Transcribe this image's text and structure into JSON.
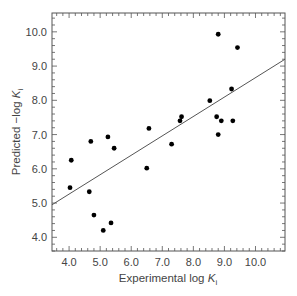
{
  "chart_data": {
    "type": "scatter",
    "title": "",
    "xlabel": "Experimental log K_i",
    "xlabel_main": "Experimental log ",
    "xlabel_var": "K",
    "xlabel_sub": "i",
    "ylabel": "Predicted −log K_i",
    "ylabel_main": "Predicted −log ",
    "ylabel_var": "K",
    "ylabel_sub": "i",
    "xlim": [
      3.45,
      10.95
    ],
    "ylim": [
      3.6,
      10.55
    ],
    "xticks": [
      4.0,
      5.0,
      6.0,
      7.0,
      8.0,
      9.0,
      10.0
    ],
    "xtick_labels": [
      "4.0",
      "5.0",
      "6.0",
      "7.0",
      "8.0",
      "9.0",
      "10.0"
    ],
    "yticks": [
      4.0,
      5.0,
      6.0,
      7.0,
      8.0,
      9.0,
      10.0
    ],
    "ytick_labels": [
      "4.0",
      "5.0",
      "6.0",
      "7.0",
      "8.0",
      "9.0",
      "10.0"
    ],
    "minor_ticks_per_major": 5,
    "grid": false,
    "legend": null,
    "series": [
      {
        "name": "compounds",
        "marker": "filled-circle",
        "color": "#000000",
        "points": [
          {
            "x": 4.03,
            "y": 5.45
          },
          {
            "x": 4.07,
            "y": 6.25
          },
          {
            "x": 4.65,
            "y": 5.33
          },
          {
            "x": 4.7,
            "y": 6.8
          },
          {
            "x": 4.8,
            "y": 4.65
          },
          {
            "x": 5.1,
            "y": 4.2
          },
          {
            "x": 5.25,
            "y": 6.93
          },
          {
            "x": 5.35,
            "y": 4.42
          },
          {
            "x": 5.45,
            "y": 6.6
          },
          {
            "x": 6.5,
            "y": 6.02
          },
          {
            "x": 6.57,
            "y": 7.18
          },
          {
            "x": 7.3,
            "y": 6.72
          },
          {
            "x": 7.57,
            "y": 7.4
          },
          {
            "x": 7.62,
            "y": 7.52
          },
          {
            "x": 8.53,
            "y": 7.99
          },
          {
            "x": 8.75,
            "y": 7.52
          },
          {
            "x": 8.8,
            "y": 9.93
          },
          {
            "x": 8.8,
            "y": 7.0
          },
          {
            "x": 8.9,
            "y": 7.4
          },
          {
            "x": 9.23,
            "y": 8.33
          },
          {
            "x": 9.27,
            "y": 7.4
          },
          {
            "x": 9.42,
            "y": 9.54
          }
        ]
      }
    ],
    "fit_line": {
      "name": "regression",
      "color": "#555555",
      "x": [
        3.45,
        10.95
      ],
      "y": [
        4.95,
        9.2
      ]
    }
  }
}
